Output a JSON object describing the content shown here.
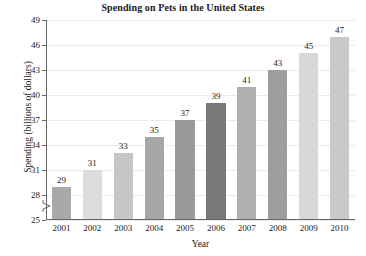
{
  "chart_data": {
    "type": "bar",
    "title": "Spending on Pets in the United States",
    "xlabel": "Year",
    "ylabel": "Spending (billions of dollars)",
    "categories": [
      "2001",
      "2002",
      "2003",
      "2004",
      "2005",
      "2006",
      "2007",
      "2008",
      "2009",
      "2010"
    ],
    "values": [
      29,
      31,
      33,
      35,
      37,
      39,
      41,
      43,
      45,
      47
    ],
    "value_labels": [
      "29",
      "31",
      "33",
      "35",
      "37",
      "39",
      "41",
      "43",
      "45",
      "47"
    ],
    "ylim": [
      25,
      49
    ],
    "ytick_labels": [
      "25",
      "28",
      "31",
      "34",
      "37",
      "40",
      "43",
      "46",
      "49"
    ],
    "ytick_values": [
      25,
      28,
      31,
      34,
      37,
      40,
      43,
      46,
      49
    ],
    "grid": "horizontal",
    "legend": "none",
    "axis_break": true,
    "axis_break_note": "y-axis broken below 25",
    "bar_colors": [
      "#a9a9a9",
      "#dcdcdc",
      "#c6c6c6",
      "#a6a6a6",
      "#9a9a9a",
      "#787878",
      "#b0b0b0",
      "#9e9e9e",
      "#d8d8d8",
      "#c9c9c9"
    ],
    "grid_color": "#eceaea",
    "axis_color": "#666666",
    "text_color": "#1a1a1a",
    "background": "#ffffff"
  }
}
